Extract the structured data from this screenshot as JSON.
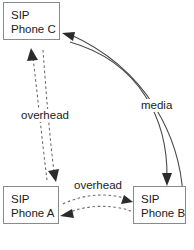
{
  "diagram": {
    "background_color": "#ffffff",
    "box_border_color": "#8a8a8a",
    "solid_edge_color": "#4a4a4a",
    "dashed_edge_color": "#6e6e6e",
    "nodes": [
      {
        "id": "phone-c",
        "line1": "SIP",
        "line2": "Phone C",
        "x": 3,
        "y": 2,
        "w": 57,
        "h": 38
      },
      {
        "id": "phone-a",
        "line1": "SIP",
        "line2": "Phone A",
        "x": 3,
        "y": 186,
        "w": 56,
        "h": 38
      },
      {
        "id": "phone-b",
        "line1": "SIP",
        "line2": "Phone B",
        "x": 133,
        "y": 186,
        "w": 53,
        "h": 38
      }
    ],
    "labels": [
      {
        "id": "overhead-left",
        "text": "overhead",
        "x": 19,
        "y": 109
      },
      {
        "id": "media-right",
        "text": "media",
        "x": 139,
        "y": 99
      },
      {
        "id": "overhead-bottom",
        "text": "overhead",
        "x": 72,
        "y": 179
      }
    ],
    "edges": [
      {
        "id": "media-b-to-c",
        "style": "solid",
        "label": "media",
        "from": "phone-b",
        "to": "phone-c"
      },
      {
        "id": "media-c-to-b",
        "style": "solid",
        "label": "media",
        "from": "phone-c",
        "to": "phone-b"
      },
      {
        "id": "overhead-a-to-c",
        "style": "dashed",
        "label": "overhead",
        "from": "phone-a",
        "to": "phone-c"
      },
      {
        "id": "overhead-c-to-a",
        "style": "dashed",
        "label": "overhead",
        "from": "phone-c",
        "to": "phone-a"
      },
      {
        "id": "overhead-a-to-b",
        "style": "dashed",
        "label": "overhead",
        "from": "phone-a",
        "to": "phone-b"
      },
      {
        "id": "overhead-b-to-a",
        "style": "dashed",
        "label": "overhead",
        "from": "phone-b",
        "to": "phone-a"
      }
    ]
  }
}
